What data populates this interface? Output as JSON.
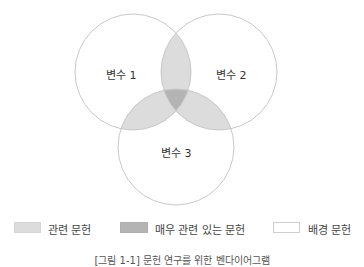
{
  "diagram": {
    "type": "venn",
    "circles": [
      {
        "label": "변수 1"
      },
      {
        "label": "변수 2"
      },
      {
        "label": "변수 3"
      }
    ],
    "colors": {
      "stroke": "#c8c8c8",
      "pairwise_overlap": "#dcdcdc",
      "triple_overlap": "#b4b4b4",
      "background": "#ffffff"
    }
  },
  "legend": {
    "items": [
      {
        "label": "관련 문헌",
        "color": "#dcdcdc"
      },
      {
        "label": "매우 관련 있는 문헌",
        "color": "#b4b4b4"
      },
      {
        "label": "배경 문헌",
        "color": "#ffffff"
      }
    ]
  },
  "caption": "[그림 1-1] 문헌 연구를 위한 벤다이어그램"
}
